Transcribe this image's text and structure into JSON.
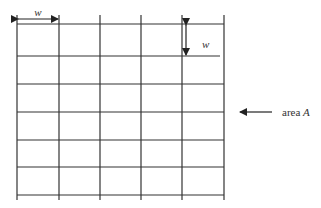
{
  "diagram": {
    "grid": {
      "x_lines": [
        17,
        59,
        100,
        141,
        182,
        224
      ],
      "y_lines": [
        24,
        56,
        84,
        112,
        140,
        167,
        195
      ],
      "v_top": 15,
      "v_bottom": 200,
      "stroke": "#333333"
    },
    "width_dimension": {
      "label": "w",
      "x1": 17,
      "x2": 59,
      "y": 19
    },
    "height_dimension": {
      "label": "w",
      "x": 186,
      "y1": 24,
      "y2": 56
    },
    "area_pointer": {
      "prefix": "area ",
      "variable": "A",
      "arrow_from_x": 272,
      "arrow_to_x": 240,
      "y": 112
    }
  }
}
